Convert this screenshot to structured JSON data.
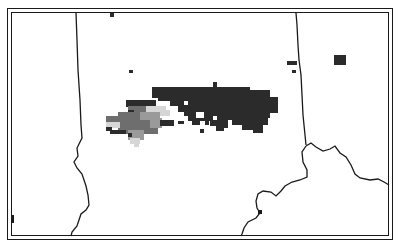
{
  "map": {
    "type": "radar-reflectivity-map",
    "background": "#ffffff",
    "border_color": "#1a1a1a",
    "boundary_color": "#1a1a1a",
    "intensity_colors": {
      "light": "#d6d6d6",
      "medium": "#9a9a9a",
      "strong": "#6e6e6e",
      "heavy": "#2b2b2b"
    }
  }
}
